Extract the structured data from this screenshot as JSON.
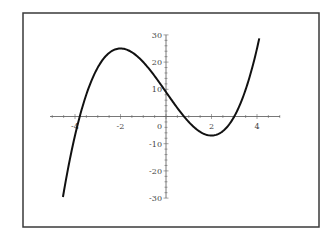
{
  "chart_data": {
    "type": "line",
    "title": "",
    "xlabel": "",
    "ylabel": "",
    "function": "y = x^3 - 12x + 9",
    "xlim": [
      -5,
      5
    ],
    "ylim": [
      -30,
      30
    ],
    "x_ticks": [
      -4,
      -2,
      0,
      2,
      4
    ],
    "x_tick_labels": [
      "-4",
      "-2",
      "0",
      "2",
      "4"
    ],
    "y_ticks": [
      -30,
      -20,
      -10,
      0,
      10,
      20,
      30
    ],
    "y_tick_labels": [
      "-30",
      "-20",
      "-10",
      "0",
      "10",
      "20",
      "30"
    ],
    "grid": false,
    "legend": null,
    "series": [
      {
        "name": "f(x)",
        "x": [
          -4.53,
          -4,
          -3.5,
          -3,
          -2.5,
          -2,
          -1.5,
          -1,
          -0.5,
          0,
          0.5,
          1,
          1.5,
          2,
          2.5,
          3,
          3.5,
          4,
          4.1
        ],
        "y": [
          -29.6,
          -7,
          8.1,
          18,
          23.4,
          25,
          23.6,
          20,
          14.9,
          9,
          3.1,
          -2,
          -5.6,
          -7,
          -5.4,
          0,
          9.9,
          25,
          28.7
        ]
      }
    ],
    "key_points": {
      "local_max": {
        "x": -2,
        "y": 25
      },
      "local_min": {
        "x": 2,
        "y": -7
      },
      "y_intercept": {
        "x": 0,
        "y": 9
      }
    }
  },
  "colors": {
    "background": "#ffffff",
    "frame": "#3a3a3a",
    "curve": "#111111",
    "axis": "#555555"
  }
}
